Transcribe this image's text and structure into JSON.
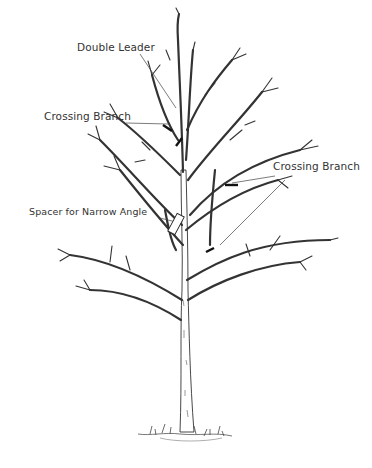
{
  "diagram": {
    "labels": [
      {
        "id": "double-leader",
        "text": "Double Leader",
        "x": 77,
        "y": 41
      },
      {
        "id": "crossing-branch-left",
        "text": "Crossing Branch",
        "x": 44,
        "y": 110
      },
      {
        "id": "crossing-branch-right",
        "text": "Crossing Branch",
        "x": 273,
        "y": 160
      },
      {
        "id": "spacer-narrow-angle",
        "text": "Spacer for Narrow Angle",
        "x": 29,
        "y": 206
      }
    ],
    "colors": {
      "ink": "#333333",
      "background": "#ffffff",
      "cut_marks": "#111111"
    }
  }
}
